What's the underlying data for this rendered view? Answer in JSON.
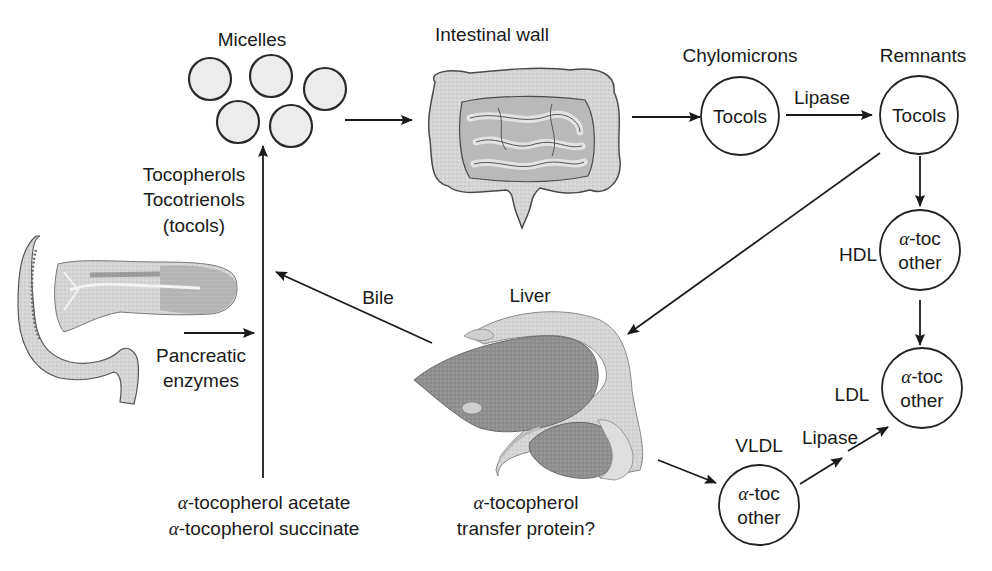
{
  "diagram": {
    "labels": {
      "micelles": "Micelles",
      "intestinal_wall": "Intestinal wall",
      "chylomicrons": "Chylomicrons",
      "remnants": "Remnants",
      "tocopherols": "Tocopherols",
      "tocotrienols": "Tocotrienols",
      "tocols": "(tocols)",
      "pancreatic": "Pancreatic",
      "enzymes": "enzymes",
      "bile": "Bile",
      "liver": "Liver",
      "hdl": "HDL",
      "ldl": "LDL",
      "vldl": "VLDL",
      "lipase_top": "Lipase",
      "lipase_bottom": "Lipase"
    },
    "nodes": {
      "chylomicrons_content": "Tocols",
      "remnants_content": "Tocols",
      "hdl": {
        "greek": "α",
        "line1_suffix": "-toc",
        "line2": "other"
      },
      "ldl": {
        "greek": "α",
        "line1_suffix": "-toc",
        "line2": "other"
      },
      "vldl": {
        "greek": "α",
        "line1_suffix": "-toc",
        "line2": "other"
      }
    },
    "bottom_left": {
      "line1_greek": "α",
      "line1": "-tocopherol acetate",
      "line2_greek": "α",
      "line2": "-tocopherol succinate"
    },
    "bottom_center": {
      "line1_greek": "α",
      "line1": "-tocopherol",
      "line2": "transfer protein?"
    },
    "illustrations": [
      "micelles",
      "intestines",
      "pancreas",
      "liver"
    ],
    "colors": {
      "line": "#1a1a1a",
      "organ_fill": "#9a9a9a",
      "organ_light": "#d8d8d8",
      "background": "#ffffff"
    }
  }
}
